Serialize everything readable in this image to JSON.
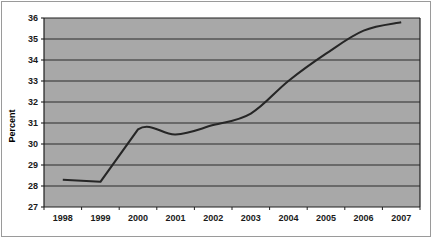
{
  "chart_data": {
    "type": "line",
    "title": "",
    "subtitle": "",
    "xlabel": "",
    "ylabel": "Percent",
    "categories": [
      "1998",
      "1999",
      "2000",
      "2001",
      "2002",
      "2003",
      "2004",
      "2005",
      "2006",
      "2007"
    ],
    "values": [
      28.3,
      28.2,
      30.7,
      30.45,
      30.9,
      31.45,
      33.0,
      34.3,
      35.4,
      35.8
    ],
    "series": [
      {
        "name": "Percent",
        "values": [
          28.3,
          28.2,
          30.7,
          30.45,
          30.9,
          31.45,
          33.0,
          34.3,
          35.4,
          35.8
        ]
      }
    ],
    "ylim": [
      27,
      36
    ],
    "ytick_labels": [
      "36",
      "35",
      "34",
      "33",
      "32",
      "31",
      "30",
      "29",
      "28",
      "27"
    ],
    "ytick_values": [
      36,
      35,
      34,
      33,
      32,
      31,
      30,
      29,
      28,
      27
    ],
    "xtick_labels": [
      "1998",
      "1999",
      "2000",
      "2001",
      "2002",
      "2003",
      "2004",
      "2005",
      "2006",
      "2007"
    ],
    "grid": "horizontal",
    "legend": "none",
    "annotations": [],
    "colors": {
      "plot_background": "#a8a8a8",
      "gridline": "#2b2b2b",
      "line": "#262626",
      "axis": "#1f1f1f",
      "page_background": "#ffffff",
      "border": "#9a9a9a",
      "text": "#1a1a1a"
    }
  },
  "axes": {
    "y_axis_title": "Percent"
  }
}
